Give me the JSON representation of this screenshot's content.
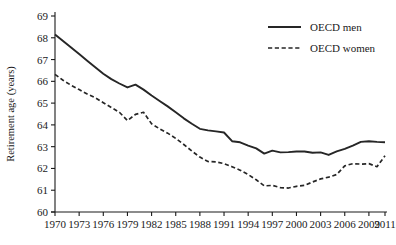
{
  "chart_data": {
    "type": "line",
    "title": "",
    "xlabel": "",
    "ylabel": "Retirement age (years)",
    "ylim": [
      60,
      69
    ],
    "xlim": [
      1970,
      2011
    ],
    "grid": false,
    "legend_position": "top-right",
    "ytick_labels": [
      "60",
      "61",
      "62",
      "63",
      "64",
      "65",
      "66",
      "67",
      "68",
      "69"
    ],
    "ytick_values": [
      60,
      61,
      62,
      63,
      64,
      65,
      66,
      67,
      68,
      69
    ],
    "xtick_labels": [
      "1970",
      "1973",
      "1976",
      "1979",
      "1982",
      "1985",
      "1988",
      "1991",
      "1994",
      "1997",
      "2000",
      "2003",
      "2006",
      "2009",
      "2011"
    ],
    "xtick_values": [
      1970,
      1973,
      1976,
      1979,
      1982,
      1985,
      1988,
      1991,
      1994,
      1997,
      2000,
      2003,
      2006,
      2009,
      2011
    ],
    "x": [
      1970,
      1971,
      1972,
      1973,
      1974,
      1975,
      1976,
      1977,
      1978,
      1979,
      1980,
      1981,
      1982,
      1983,
      1984,
      1985,
      1986,
      1987,
      1988,
      1989,
      1990,
      1991,
      1992,
      1993,
      1994,
      1995,
      1996,
      1997,
      1998,
      1999,
      2000,
      2001,
      2002,
      2003,
      2004,
      2005,
      2006,
      2007,
      2008,
      2009,
      2010,
      2011
    ],
    "series": [
      {
        "name": "OECD men",
        "style": "solid",
        "color": "#262626",
        "values": [
          68.15,
          67.85,
          67.55,
          67.25,
          66.95,
          66.65,
          66.35,
          66.1,
          65.9,
          65.72,
          65.85,
          65.62,
          65.35,
          65.1,
          64.85,
          64.58,
          64.3,
          64.05,
          63.82,
          63.75,
          63.7,
          63.65,
          63.25,
          63.2,
          63.05,
          62.92,
          62.68,
          62.82,
          62.74,
          62.75,
          62.78,
          62.78,
          62.72,
          62.74,
          62.62,
          62.78,
          62.9,
          63.05,
          63.22,
          63.25,
          63.22,
          63.2
        ]
      },
      {
        "name": "OECD women",
        "style": "dashed",
        "color": "#262626",
        "values": [
          66.32,
          66.05,
          65.82,
          65.62,
          65.42,
          65.25,
          65.02,
          64.8,
          64.58,
          64.2,
          64.48,
          64.58,
          64.05,
          63.82,
          63.62,
          63.38,
          63.1,
          62.8,
          62.52,
          62.32,
          62.3,
          62.22,
          62.08,
          61.92,
          61.72,
          61.48,
          61.2,
          61.22,
          61.12,
          61.1,
          61.18,
          61.22,
          61.38,
          61.52,
          61.6,
          61.72,
          62.12,
          62.22,
          62.2,
          62.22,
          62.08,
          62.58
        ]
      }
    ]
  },
  "legend": {
    "items": [
      {
        "label": "OECD men",
        "style": "solid"
      },
      {
        "label": "OECD women",
        "style": "dashed"
      }
    ]
  }
}
